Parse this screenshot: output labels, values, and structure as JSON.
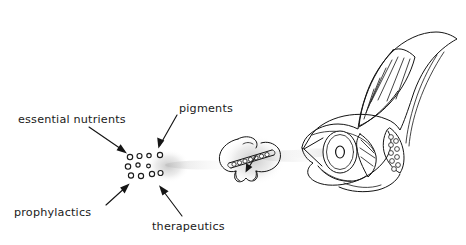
{
  "figure": {
    "background_color": "#ffffff",
    "ink_color": "#141414",
    "haze_color": "#b9b9b9",
    "width": 466,
    "height": 245
  },
  "labels": [
    {
      "id": "essential-nutrients",
      "text": "essential nutrients",
      "x": 18,
      "y": 119,
      "anchor": "start"
    },
    {
      "id": "pigments",
      "text": "pigments",
      "x": 178,
      "y": 108,
      "anchor": "start"
    },
    {
      "id": "prophylactics",
      "text": "prophylactics",
      "x": 14,
      "y": 215,
      "anchor": "start"
    },
    {
      "id": "therapeutics",
      "text": "therapeutics",
      "x": 150,
      "y": 228,
      "anchor": "start"
    }
  ],
  "arrows": [
    {
      "id": "arrow-essential-nutrients",
      "from_label": "essential nutrients",
      "points": "90,126 126,152",
      "head": "128,153 118,148 121,143"
    },
    {
      "id": "arrow-pigments",
      "from_label": "pigments",
      "points": "176,114 158,147",
      "head": "157,149 157,140 163,144"
    },
    {
      "id": "arrow-prophylactics",
      "from_label": "prophylactics",
      "points": "108,203 126,184"
    },
    {
      "id": "arrow-therapeutics",
      "from_label": "therapeutics",
      "points": "180,214 159,186"
    }
  ],
  "particles": {
    "name": "microdiet-particle-cluster",
    "count": 11,
    "radius": 2.6,
    "positions": [
      [
        130,
        157
      ],
      [
        139,
        156
      ],
      [
        149,
        155
      ],
      [
        160,
        155
      ],
      [
        128,
        166
      ],
      [
        138,
        165
      ],
      [
        148,
        166
      ],
      [
        131,
        175
      ],
      [
        141,
        176
      ],
      [
        152,
        174
      ],
      [
        160,
        173
      ]
    ]
  },
  "organisms": [
    {
      "id": "live-prey-zooplankton",
      "name": "live prey (enriched zooplankton)",
      "center_x": 251,
      "center_y": 158
    },
    {
      "id": "fish-larva",
      "name": "fish larva",
      "center_x": 385,
      "center_y": 120,
      "eye_marker": "o"
    }
  ],
  "haze_trails": [
    {
      "id": "haze-particles",
      "cx": 166,
      "cy": 166
    },
    {
      "id": "haze-prey",
      "cx": 254,
      "cy": 160
    },
    {
      "id": "haze-larva",
      "cx": 313,
      "cy": 152
    }
  ]
}
